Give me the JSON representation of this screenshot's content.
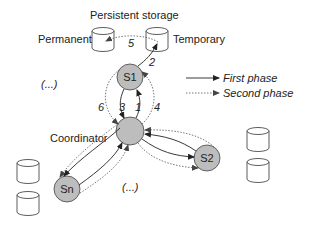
{
  "diagram": {
    "storage_title": "Persistent storage",
    "storage_permanent_label": "Permanent",
    "storage_temporary_label": "Temporary",
    "nodes": {
      "s1": "S1",
      "s2": "S2",
      "sn": "Sn",
      "coordinator_label": "Coordinator"
    },
    "ellipsis_top": "(...)",
    "ellipsis_bottom": "(...)",
    "step_labels": {
      "step1": "1",
      "step2": "2",
      "step3": "3",
      "step4": "4",
      "step5": "5",
      "step6": "6"
    },
    "legend": {
      "first_phase": "First phase",
      "second_phase": "Second phase"
    },
    "colors": {
      "node_fill": "#bdbdbd",
      "stroke": "#333333",
      "dashed_stroke": "#666666"
    }
  }
}
